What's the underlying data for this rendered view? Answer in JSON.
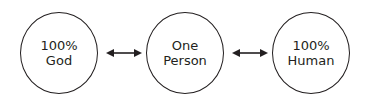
{
  "nodes": [
    {
      "line1": "100%",
      "line2": "God"
    },
    {
      "line1": "One",
      "line2": "Person"
    },
    {
      "line1": "100%",
      "line2": "Human"
    }
  ],
  "connectors": [
    {
      "from": "100% God",
      "to": "One Person",
      "type": "double-arrow"
    },
    {
      "from": "One Person",
      "to": "100% Human",
      "type": "double-arrow"
    }
  ],
  "colors": {
    "stroke": "#231f20",
    "background": "#ffffff"
  }
}
